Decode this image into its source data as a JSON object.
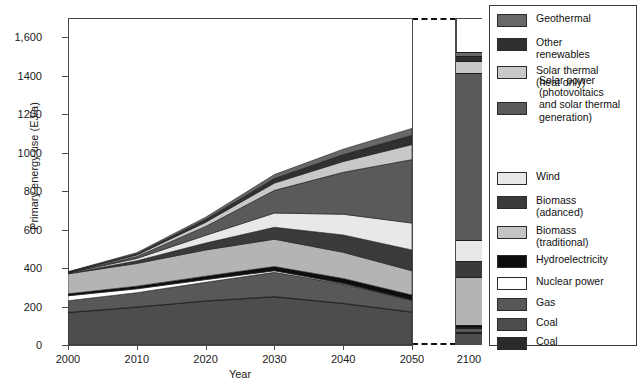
{
  "chart_data": {
    "type": "area",
    "title": "",
    "xlabel": "Year",
    "ylabel": "Primary energy use (EJ/a)",
    "xlim": [
      2000,
      2050
    ],
    "ylim": [
      0,
      1700
    ],
    "yticks": [
      0,
      200,
      400,
      600,
      800,
      1000,
      1200,
      1400,
      1600
    ],
    "ytick_labels": [
      "0",
      "200",
      "400",
      "600",
      "800",
      "1000",
      "1200",
      "1400",
      "1,600"
    ],
    "xticks": [
      2000,
      2010,
      2020,
      2030,
      2040,
      2050
    ],
    "xtick_labels": [
      "2000",
      "2010",
      "2020",
      "2030",
      "2040",
      "2050"
    ],
    "extra_xtick_label": "2100",
    "grid": false,
    "legend_position": "right",
    "axis_break": true,
    "x": [
      2000,
      2010,
      2020,
      2030,
      2040,
      2050
    ],
    "series": [
      {
        "name": "Coal",
        "color": "#4d4d4d",
        "values": [
          168,
          196,
          228,
          250,
          215,
          170
        ],
        "panel2100": 60
      },
      {
        "name": "Coal",
        "color": "#2b2b2b",
        "values": [
          2,
          2,
          2,
          2,
          2,
          2
        ],
        "panel2100": 8
      },
      {
        "name": "Gas",
        "color": "#585858",
        "values": [
          60,
          74,
          96,
          126,
          100,
          60
        ],
        "panel2100": 18
      },
      {
        "name": "Nuclear power",
        "color": "#ffffff",
        "values": [
          26,
          20,
          14,
          8,
          4,
          2
        ],
        "panel2100": 6
      },
      {
        "name": "Hydroelectricity",
        "color": "#0d0d0d",
        "values": [
          10,
          14,
          18,
          22,
          25,
          26
        ],
        "panel2100": 10
      },
      {
        "name": "Biomass (traditional)",
        "color": "#b4b4b4",
        "values": [
          104,
          118,
          136,
          142,
          136,
          126
        ],
        "panel2100": 250
      },
      {
        "name": "Biomass (adanced)",
        "color": "#3a3a3a",
        "values": [
          2,
          14,
          36,
          62,
          90,
          108
        ],
        "panel2100": 84
      },
      {
        "name": "Wind",
        "color": "#e8e8e8",
        "values": [
          2,
          12,
          40,
          74,
          108,
          140
        ],
        "panel2100": 108
      },
      {
        "name": "Solar power",
        "color": "#5a5a5a",
        "values": [
          1,
          10,
          46,
          118,
          218,
          330
        ],
        "panel2100": 870
      },
      {
        "name": "Solar thermal (heat only)",
        "color": "#c8c8c8",
        "values": [
          2,
          8,
          22,
          38,
          56,
          78
        ],
        "panel2100": 60
      },
      {
        "name": "Other renewables",
        "color": "#303030",
        "values": [
          2,
          6,
          14,
          24,
          36,
          48
        ],
        "panel2100": 26
      },
      {
        "name": "Geothermal",
        "color": "#686868",
        "values": [
          2,
          6,
          12,
          20,
          28,
          36
        ],
        "panel2100": 22
      }
    ],
    "panel2100_total": 1522
  },
  "legend": {
    "items": [
      {
        "label": "Geothermal",
        "color": "#686868"
      },
      {
        "label": "Other\nrenewables",
        "color": "#303030"
      },
      {
        "label": "Solar thermal\n(heat only)",
        "color": "#c8c8c8"
      },
      {
        "label": " Solar power\n(photovoltaics\nand solar thermal\ngeneration)",
        "color": "#5a5a5a"
      },
      {
        "label": "Wind",
        "color": "#e8e8e8"
      },
      {
        "label": "Biomass\n(adanced)",
        "color": "#3a3a3a"
      },
      {
        "label": "Biomass\n(traditional)",
        "color": "#c4c4c4"
      },
      {
        "label": "Hydroelectricity",
        "color": "#0d0d0d"
      },
      {
        "label": "Nuclear power",
        "color": "#ffffff"
      },
      {
        "label": "Gas",
        "color": "#585858"
      },
      {
        "label": "Coal",
        "color": "#4d4d4d"
      },
      {
        "label": "Coal",
        "color": "#2b2b2b"
      }
    ]
  }
}
